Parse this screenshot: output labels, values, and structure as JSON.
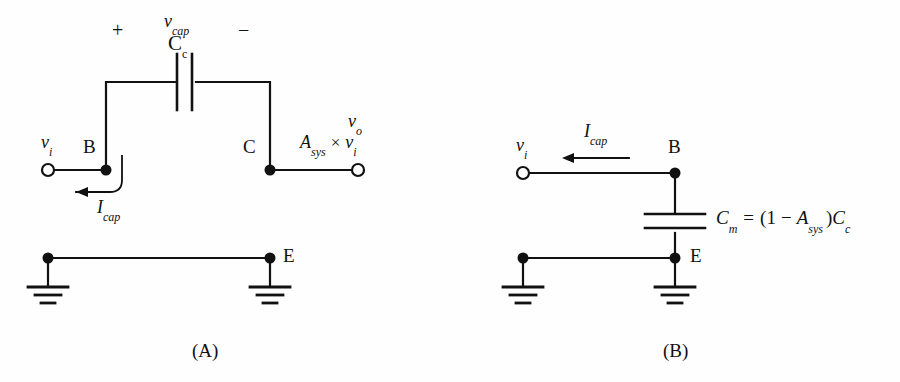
{
  "figure": {
    "background_color": "#fefefe",
    "ink_color": "#111111"
  },
  "panel_a": {
    "caption": "(A)",
    "input_terminal_label": "v",
    "input_terminal_sub": "i",
    "node_b_label": "B",
    "node_c_label": "C",
    "node_e_label": "E",
    "plus_sign": "+",
    "minus_sign": "−",
    "cap_voltage_label": "v",
    "cap_voltage_sub": "cap",
    "cap_name_label": "C",
    "cap_name_sub": "c",
    "current_label": "I",
    "current_sub": "cap",
    "output_label": "v",
    "output_sub": "o",
    "output_expr_gain": "A",
    "output_expr_gain_sub": "sys",
    "output_expr_times": "×",
    "output_expr_input": "v",
    "output_expr_input_sub": "i"
  },
  "panel_b": {
    "caption": "(B)",
    "input_terminal_label": "v",
    "input_terminal_sub": "i",
    "node_b_label": "B",
    "node_e_label": "E",
    "current_label": "I",
    "current_sub": "cap",
    "equation": {
      "lhs": "C",
      "lhs_sub": "m",
      "equals": "=",
      "open_paren": "(",
      "one": "1",
      "minus": "−",
      "gain": "A",
      "gain_sub": "sys",
      "close_paren": ")",
      "cap": "C",
      "cap_sub": "c",
      "full_text": "C_m = (1 − A_sys )C_c"
    }
  }
}
